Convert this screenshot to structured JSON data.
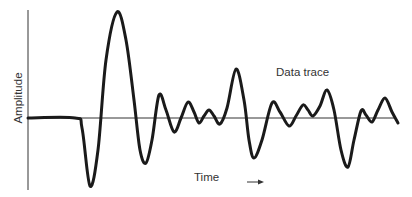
{
  "chart_data": {
    "type": "line",
    "title": "",
    "xlabel": "Time",
    "ylabel": "Amplitude",
    "annotations": [
      "Data trace"
    ],
    "grid": false,
    "legend": null,
    "axis_ticks": "none",
    "x_arrow": true,
    "series": [
      {
        "name": "Data trace",
        "points_px": [
          [
            28,
            118
          ],
          [
            75,
            118
          ],
          [
            82,
            128
          ],
          [
            90,
            186
          ],
          [
            98,
            150
          ],
          [
            106,
            60
          ],
          [
            117,
            12
          ],
          [
            126,
            40
          ],
          [
            134,
            100
          ],
          [
            140,
            150
          ],
          [
            146,
            163
          ],
          [
            152,
            140
          ],
          [
            159,
            95
          ],
          [
            166,
            110
          ],
          [
            174,
            132
          ],
          [
            181,
            118
          ],
          [
            188,
            102
          ],
          [
            194,
            112
          ],
          [
            199,
            123
          ],
          [
            204,
            116
          ],
          [
            209,
            110
          ],
          [
            214,
            116
          ],
          [
            220,
            124
          ],
          [
            227,
            108
          ],
          [
            236,
            69
          ],
          [
            244,
            100
          ],
          [
            249,
            140
          ],
          [
            254,
            158
          ],
          [
            262,
            140
          ],
          [
            272,
            103
          ],
          [
            280,
            112
          ],
          [
            289,
            126
          ],
          [
            296,
            116
          ],
          [
            303,
            105
          ],
          [
            308,
            110
          ],
          [
            313,
            116
          ],
          [
            320,
            106
          ],
          [
            327,
            90
          ],
          [
            334,
            110
          ],
          [
            341,
            150
          ],
          [
            348,
            167
          ],
          [
            354,
            140
          ],
          [
            361,
            111
          ],
          [
            366,
            115
          ],
          [
            372,
            122
          ],
          [
            378,
            110
          ],
          [
            385,
            98
          ],
          [
            392,
            112
          ],
          [
            398,
            123
          ]
        ],
        "baseline_y_px": 118
      }
    ]
  },
  "labels": {
    "ylabel": "Amplitude",
    "xlabel": "Time",
    "trace": "Data trace"
  },
  "colors": {
    "trace": "#1a1a1a",
    "axis": "#333333",
    "text": "#333333"
  }
}
